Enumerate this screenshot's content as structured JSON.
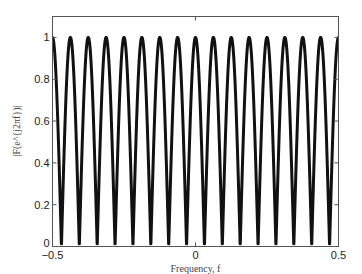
{
  "chart_data": {
    "type": "line",
    "title": "",
    "xlabel": "Frequency, f",
    "ylabel": "|F(e^{j2πf})|",
    "xlim": [
      -0.5,
      0.5
    ],
    "ylim": [
      0,
      1.1
    ],
    "xticks": [
      -0.5,
      0,
      0.5
    ],
    "xtick_labels": [
      "-0.5",
      "0",
      "0.5"
    ],
    "yticks": [
      0,
      0.2,
      0.4,
      0.6,
      0.8,
      1
    ],
    "ytick_labels": [
      "0",
      "0.2",
      "0.4",
      "0.6",
      "0.8",
      "1"
    ],
    "grid": false,
    "legend": null,
    "series": [
      {
        "name": "|F(e^{j2πf})|",
        "function": "|cos(16πf)|",
        "periods_in_range": 16,
        "peak_value": 1,
        "min_value": 0,
        "peak_positions": [
          -0.5,
          -0.4375,
          -0.375,
          -0.3125,
          -0.25,
          -0.1875,
          -0.125,
          -0.0625,
          0,
          0.0625,
          0.125,
          0.1875,
          0.25,
          0.3125,
          0.375,
          0.4375,
          0.5
        ],
        "zero_positions": [
          -0.46875,
          -0.40625,
          -0.34375,
          -0.28125,
          -0.21875,
          -0.15625,
          -0.09375,
          -0.03125,
          0.03125,
          0.09375,
          0.15625,
          0.21875,
          0.28125,
          0.34375,
          0.40625,
          0.46875
        ],
        "color": "#111111",
        "line_width": 3
      }
    ]
  }
}
